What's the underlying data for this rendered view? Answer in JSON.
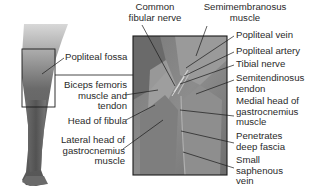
{
  "diagram": {
    "inset": {
      "label": "Popliteal fossa"
    },
    "labels_top": [
      {
        "id": "common-fibular-nerve",
        "lines": [
          "Common",
          "fibular nerve"
        ]
      },
      {
        "id": "semimembranosus-muscle",
        "lines": [
          "Semimembranosus",
          "muscle"
        ]
      }
    ],
    "labels_left": [
      {
        "id": "popliteal-fossa",
        "lines": [
          "Popliteal fossa"
        ]
      },
      {
        "id": "biceps-femoris",
        "lines": [
          "Biceps femoris",
          "muscle and",
          "tendon"
        ]
      },
      {
        "id": "head-of-fibula",
        "lines": [
          "Head of fibula"
        ]
      },
      {
        "id": "lateral-head-gastrocnemius",
        "lines": [
          "Lateral head of",
          "gastrocnemius",
          "muscle"
        ]
      }
    ],
    "labels_right": [
      {
        "id": "popliteal-vein",
        "lines": [
          "Popliteal vein"
        ]
      },
      {
        "id": "popliteal-artery",
        "lines": [
          "Popliteal artery"
        ]
      },
      {
        "id": "tibial-nerve",
        "lines": [
          "Tibial nerve"
        ]
      },
      {
        "id": "semitendinosus-tendon",
        "lines": [
          "Semitendinosus",
          "tendon"
        ]
      },
      {
        "id": "medial-head-gastrocnemius",
        "lines": [
          "Medial head of",
          "gastrocnemius",
          "muscle"
        ]
      },
      {
        "id": "penetrates-deep-fascia",
        "lines": [
          "Penetrates",
          "deep fascia"
        ]
      },
      {
        "id": "small-saphenous-vein",
        "lines": [
          "Small",
          "saphenous",
          "vein"
        ]
      }
    ],
    "colors": {
      "background": "#ffffff",
      "text": "#2a2a2a",
      "leader_line": "#1a1a1a",
      "panel_border": "#1a1a1a",
      "tissue_dark": "#5a5a5a",
      "tissue_mid": "#8a8a8a",
      "tissue_light": "#b5b5b5"
    }
  }
}
